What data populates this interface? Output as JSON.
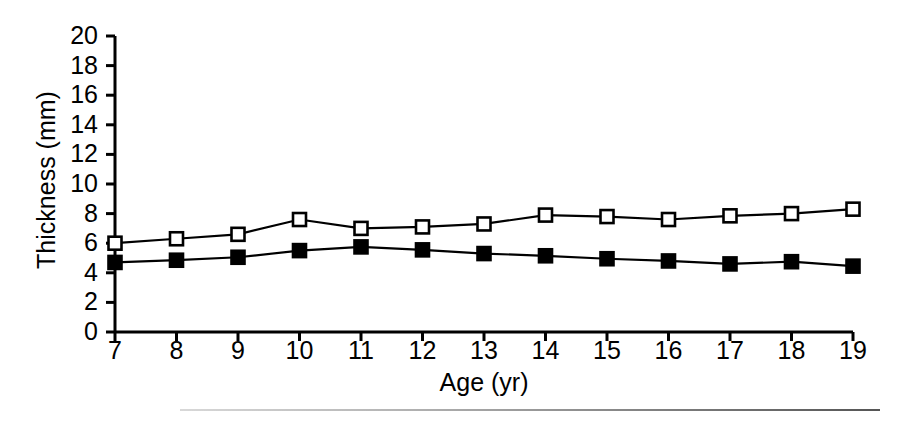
{
  "chart_data": {
    "type": "line",
    "title": "",
    "xlabel": "Age (yr)",
    "ylabel": "Thickness (mm)",
    "x": [
      7,
      8,
      9,
      10,
      11,
      12,
      13,
      14,
      15,
      16,
      17,
      18,
      19
    ],
    "xlim": [
      7,
      19
    ],
    "ylim": [
      0,
      20
    ],
    "xticks": [
      7,
      8,
      9,
      10,
      11,
      12,
      13,
      14,
      15,
      16,
      17,
      18,
      19
    ],
    "xtick_labels": [
      "7",
      "8",
      "9",
      "10",
      "11",
      "12",
      "13",
      "14",
      "15",
      "16",
      "17",
      "18",
      "19"
    ],
    "yticks": [
      0,
      2,
      4,
      6,
      8,
      10,
      12,
      14,
      16,
      18,
      20
    ],
    "ytick_labels": [
      "0",
      "2",
      "4",
      "6",
      "8",
      "10",
      "12",
      "14",
      "16",
      "18",
      "20"
    ],
    "grid": false,
    "legend": "none",
    "series": [
      {
        "name": "open-square-series",
        "marker": "open-square",
        "color": "#000000",
        "fill": "#ffffff",
        "values": [
          6.0,
          6.3,
          6.6,
          7.6,
          7.0,
          7.1,
          7.3,
          7.9,
          7.8,
          7.6,
          7.85,
          8.0,
          8.3
        ]
      },
      {
        "name": "filled-square-series",
        "marker": "filled-square",
        "color": "#000000",
        "fill": "#000000",
        "values": [
          4.7,
          4.85,
          5.05,
          5.5,
          5.75,
          5.55,
          5.3,
          5.15,
          4.95,
          4.8,
          4.6,
          4.75,
          4.45
        ]
      }
    ]
  },
  "figure": {
    "background_color": "#ffffff",
    "axis_color": "#000000"
  }
}
